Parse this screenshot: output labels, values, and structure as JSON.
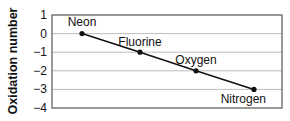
{
  "chart_data": {
    "type": "line",
    "title": "",
    "xlabel": "",
    "ylabel": "Oxidation number",
    "ylim": [
      -4,
      1
    ],
    "yticks": [
      1,
      0,
      -1,
      -2,
      -3,
      -4
    ],
    "ytick_labels": [
      "1",
      "0",
      "−1",
      "−2",
      "−3",
      "−4"
    ],
    "grid": true,
    "legend": null,
    "categories": [
      "Neon",
      "Fluorine",
      "Oxygen",
      "Nitrogen"
    ],
    "series": [
      {
        "name": "Oxidation number",
        "values": [
          0,
          -1,
          -2,
          -3
        ]
      }
    ],
    "annotations": [
      "Neon",
      "Fluorine",
      "Oxygen",
      "Nitrogen"
    ]
  },
  "colors": {
    "line": "#111111",
    "grid": "#bdbdbd",
    "frame": "#555555"
  }
}
